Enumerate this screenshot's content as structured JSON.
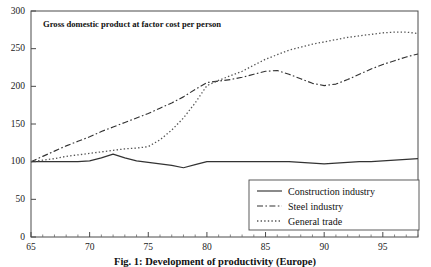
{
  "chart_data": {
    "type": "line",
    "title": "Gross domestic product at factor cost per person",
    "caption": "Fig. 1: Development of productivity (Europe)",
    "xlabel": "",
    "ylabel": "",
    "xlim": [
      65,
      98
    ],
    "ylim": [
      0,
      300
    ],
    "yticks": [
      0,
      50,
      100,
      150,
      200,
      250,
      300
    ],
    "xticks": [
      65,
      70,
      75,
      80,
      85,
      90,
      95
    ],
    "x_minor_ticks": [
      66,
      67,
      68,
      69,
      71,
      72,
      73,
      74,
      76,
      77,
      78,
      79,
      81,
      82,
      83,
      84,
      86,
      87,
      88,
      89,
      91,
      92,
      93,
      94,
      96,
      97,
      98
    ],
    "grid": false,
    "legend_position": "bottom-right",
    "x": [
      65,
      66,
      67,
      68,
      69,
      70,
      71,
      72,
      73,
      74,
      75,
      76,
      77,
      78,
      79,
      80,
      81,
      82,
      83,
      84,
      85,
      86,
      87,
      88,
      89,
      90,
      91,
      92,
      93,
      94,
      95,
      96,
      97,
      98
    ],
    "series": [
      {
        "name": "Construction industry",
        "style": "solid",
        "color": "#333333",
        "values": [
          100,
          100,
          100,
          100,
          100,
          101,
          105,
          110,
          105,
          101,
          99,
          97,
          95,
          92,
          96,
          100,
          100,
          100,
          100,
          100,
          100,
          100,
          100,
          99,
          98,
          97,
          98,
          99,
          100,
          100,
          101,
          102,
          103,
          104
        ]
      },
      {
        "name": "Steel industry",
        "style": "dash-dot",
        "color": "#333333",
        "values": [
          100,
          107,
          114,
          121,
          127,
          133,
          140,
          146,
          152,
          158,
          164,
          171,
          178,
          186,
          196,
          205,
          207,
          209,
          212,
          216,
          220,
          221,
          216,
          210,
          204,
          201,
          203,
          209,
          216,
          223,
          229,
          234,
          239,
          243
        ]
      },
      {
        "name": "General trade",
        "style": "dotted",
        "color": "#555555",
        "values": [
          100,
          102,
          104,
          107,
          109,
          111,
          113,
          115,
          117,
          118,
          120,
          129,
          142,
          158,
          178,
          201,
          208,
          214,
          220,
          228,
          236,
          242,
          248,
          252,
          256,
          259,
          262,
          265,
          267,
          269,
          271,
          272,
          272,
          270
        ]
      }
    ]
  },
  "legend": {
    "items": [
      {
        "label": "Construction industry"
      },
      {
        "label": "Steel industry"
      },
      {
        "label": "General trade"
      }
    ]
  }
}
